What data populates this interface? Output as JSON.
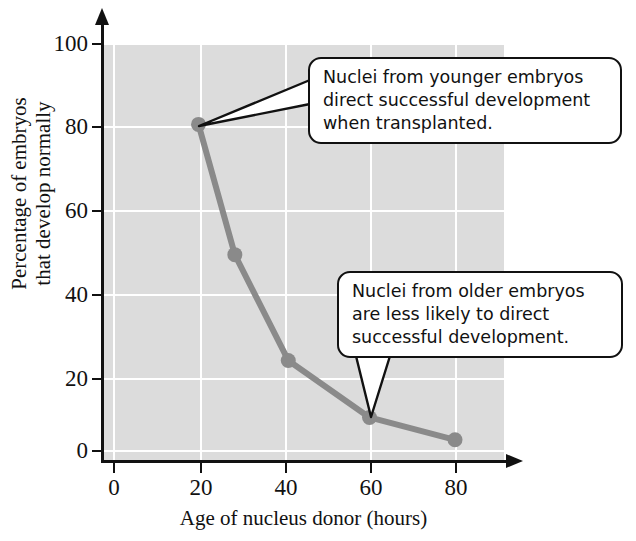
{
  "chart_data": {
    "type": "line",
    "title": "",
    "xlabel": "Age of nucleus donor (hours)",
    "ylabel": "Percentage of embryos\nthat develop normally",
    "ylabel_line1": "Percentage of embryos",
    "ylabel_line2": "that develop normally",
    "x": [
      20,
      28.5,
      41,
      60,
      80
    ],
    "values": [
      80,
      48,
      22,
      8,
      2.5
    ],
    "series": [
      {
        "name": "Percentage of embryos that develop normally",
        "x": [
          20,
          28.5,
          41,
          60,
          80
        ],
        "values": [
          80,
          48,
          22,
          8,
          2.5
        ]
      }
    ],
    "xlim": [
      0,
      92
    ],
    "ylim": [
      0,
      100
    ],
    "xticks": [
      0,
      20,
      40,
      60,
      80
    ],
    "yticks": [
      0,
      20,
      40,
      60,
      80,
      100
    ],
    "xtick_labels": [
      "0",
      "20",
      "40",
      "60",
      "80"
    ],
    "ytick_labels": [
      "0",
      "20",
      "40",
      "60",
      "80",
      "100"
    ],
    "grid": true,
    "legend": "none",
    "line_color": "#8a8a8a",
    "marker_color": "#8a8a8a",
    "plot_background": "#dcdcdc",
    "grid_color": "#ffffff",
    "axis_color": "#111111",
    "annotations": [
      {
        "id": "callout-1",
        "text": "Nuclei from younger embryos direct successful development when transplanted.",
        "lines": [
          "Nuclei from younger embryos",
          "direct successful development",
          "when transplanted."
        ],
        "points_to_x": 20,
        "points_to_y": 80
      },
      {
        "id": "callout-2",
        "text": "Nuclei from older embryos are less likely to direct successful development.",
        "lines": [
          "Nuclei from older embryos",
          "are less likely to direct",
          "successful development."
        ],
        "points_to_x": 60,
        "points_to_y": 8
      }
    ]
  }
}
